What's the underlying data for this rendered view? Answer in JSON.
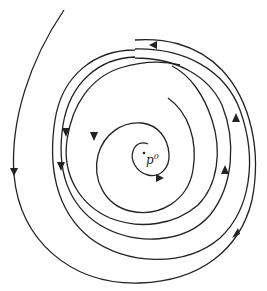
{
  "diagram": {
    "type": "phase-portrait-spiral",
    "equilibrium_point": {
      "label": "p",
      "superscript": "0",
      "x": 144,
      "y": 155
    },
    "colors": {
      "stroke": "#222222",
      "background": "#ffffff"
    },
    "trajectories": [
      {
        "name": "inner-spiral",
        "direction": "counterclockwise-outward",
        "arrows": 3
      },
      {
        "name": "middle-orbit-1",
        "direction": "counterclockwise",
        "arrows": 2
      },
      {
        "name": "middle-orbit-2",
        "direction": "counterclockwise",
        "arrows": 2
      },
      {
        "name": "outer-trajectory",
        "direction": "counterclockwise-inward-from-top-left",
        "arrows": 2
      }
    ]
  }
}
